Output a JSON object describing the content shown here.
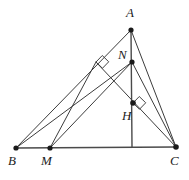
{
  "figure": {
    "type": "euclidean-geometry-diagram",
    "stroke_color": "#3c3c3c",
    "vertex_color": "#1a1a1a",
    "background_color": "#ffffff",
    "width": 189,
    "height": 180
  },
  "points": [
    {
      "id": "A",
      "label": "A",
      "x": 131,
      "y": 30,
      "label_x": 126,
      "label_y": 8,
      "marked": true
    },
    {
      "id": "N",
      "label": "N",
      "x": 132,
      "y": 62,
      "label_x": 118,
      "label_y": 50,
      "marked": true
    },
    {
      "id": "H",
      "label": "H",
      "x": 133,
      "y": 103,
      "label_x": 122,
      "label_y": 110,
      "marked": true
    },
    {
      "id": "B",
      "label": "B",
      "x": 16,
      "y": 148,
      "label_x": 9,
      "label_y": 155,
      "marked": true
    },
    {
      "id": "M",
      "label": "M",
      "x": 50,
      "y": 148,
      "label_x": 42,
      "label_y": 155,
      "marked": true
    },
    {
      "id": "C",
      "label": "C",
      "x": 176,
      "y": 147,
      "label_x": 171,
      "label_y": 155,
      "marked": true
    },
    {
      "id": "F",
      "label": "",
      "x": 96,
      "y": 62,
      "label_x": 0,
      "label_y": 0,
      "marked": false
    },
    {
      "id": "D",
      "label": "",
      "x": 132,
      "y": 147,
      "label_x": 0,
      "label_y": 0,
      "marked": false
    }
  ],
  "segments": [
    {
      "name": "side-AB",
      "from": "A",
      "to": "B",
      "style": "thin"
    },
    {
      "name": "side-AC",
      "from": "A",
      "to": "C",
      "style": "thin"
    },
    {
      "name": "side-BC",
      "from": "B",
      "to": "C",
      "style": "base"
    },
    {
      "name": "altitude-A-to-BC",
      "from": "A",
      "to": "D",
      "style": "vert"
    },
    {
      "name": "altitude-C-to-AB",
      "from": "C",
      "to": "F",
      "style": "thin"
    },
    {
      "name": "cevian-B-to-N",
      "from": "B",
      "to": "N",
      "style": "thin"
    },
    {
      "name": "cevian-M-to-N",
      "from": "M",
      "to": "N",
      "style": "thin"
    },
    {
      "name": "cevian-M-to-C-upper",
      "from": "M",
      "to": "F",
      "style": "thin"
    },
    {
      "name": "segment-N-to-C",
      "from": "N",
      "to": "C",
      "style": "thin"
    }
  ],
  "right_angle_marks": [
    {
      "name": "right-angle-at-F",
      "x": 96,
      "y": 62,
      "size": 9,
      "rot": -46
    },
    {
      "name": "right-angle-at-H",
      "x": 133,
      "y": 103,
      "size": 9,
      "rot": -46
    }
  ],
  "labels": {
    "A": "A",
    "N": "N",
    "H": "H",
    "B": "B",
    "M": "M",
    "C": "C"
  }
}
